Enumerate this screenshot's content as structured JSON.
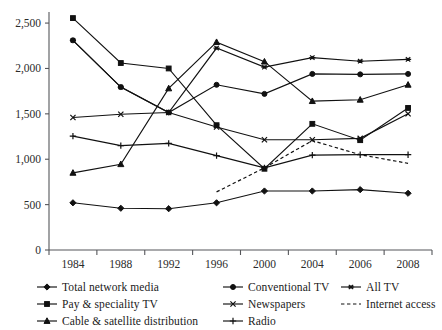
{
  "chart_data": {
    "type": "line",
    "title": "",
    "subtitle": "",
    "xlabel": "",
    "ylabel": "",
    "x": [
      "1984",
      "1988",
      "1992",
      "1996",
      "2000",
      "2004",
      "2006",
      "2008"
    ],
    "categories": [
      "1984",
      "1988",
      "1992",
      "1996",
      "2000",
      "2004",
      "2006",
      "2008"
    ],
    "xtick_labels": [
      "1984",
      "1988",
      "1992",
      "1996",
      "2000",
      "2004",
      "2006",
      "2008"
    ],
    "ytick_labels": [
      "0",
      "500",
      "1,000",
      "1,500",
      "2,000",
      "2,500"
    ],
    "ytick_values": [
      0,
      500,
      1000,
      1500,
      2000,
      2500
    ],
    "ylim": [
      0,
      2600
    ],
    "grid": false,
    "legend_position": "bottom",
    "series": [
      {
        "name": "Total network media",
        "marker": "diamond",
        "linestyle": "solid",
        "values": [
          520,
          460,
          455,
          520,
          650,
          650,
          665,
          625
        ]
      },
      {
        "name": "Conventional TV",
        "marker": "circle",
        "linestyle": "solid",
        "values": [
          2310,
          1795,
          1515,
          1820,
          1720,
          1940,
          1935,
          1940
        ]
      },
      {
        "name": "All TV",
        "marker": "asterisk",
        "linestyle": "solid",
        "values": [
          2310,
          1795,
          1515,
          2225,
          2015,
          2120,
          2080,
          2100
        ]
      },
      {
        "name": "Pay & speciality TV",
        "marker": "square",
        "linestyle": "solid",
        "values": [
          2555,
          2060,
          2000,
          1375,
          895,
          1390,
          1210,
          1565
        ]
      },
      {
        "name": "Newspapers",
        "marker": "x",
        "linestyle": "solid",
        "values": [
          1460,
          1495,
          1515,
          1355,
          1215,
          1215,
          1230,
          1500
        ]
      },
      {
        "name": "Internet access",
        "marker": "none",
        "linestyle": "dashed",
        "values": [
          null,
          null,
          null,
          640,
          905,
          1205,
          1050,
          955
        ]
      },
      {
        "name": "Cable & satellite distribution",
        "marker": "triangle",
        "linestyle": "solid",
        "values": [
          850,
          945,
          1780,
          2290,
          2075,
          1640,
          1655,
          1820
        ]
      },
      {
        "name": "Radio",
        "marker": "plus",
        "linestyle": "solid",
        "values": [
          1255,
          1150,
          1175,
          1040,
          905,
          1045,
          1050,
          1050
        ]
      }
    ]
  },
  "legend": {
    "rows": [
      [
        {
          "label": "Total network media",
          "marker": "diamond",
          "linestyle": "solid"
        },
        {
          "label": "Conventional TV",
          "marker": "circle",
          "linestyle": "solid"
        },
        {
          "label": "All TV",
          "marker": "asterisk",
          "linestyle": "solid"
        }
      ],
      [
        {
          "label": "Pay & speciality TV",
          "marker": "square",
          "linestyle": "solid"
        },
        {
          "label": "Newspapers",
          "marker": "x",
          "linestyle": "solid"
        },
        {
          "label": "Internet access",
          "marker": "none",
          "linestyle": "dashed"
        }
      ],
      [
        {
          "label": "Cable & satellite distribution",
          "marker": "triangle",
          "linestyle": "solid"
        },
        {
          "label": "Radio",
          "marker": "plus",
          "linestyle": "solid"
        }
      ]
    ]
  },
  "colors": {
    "ink": "#111111",
    "axis": "#55565a",
    "background": "#ffffff"
  }
}
